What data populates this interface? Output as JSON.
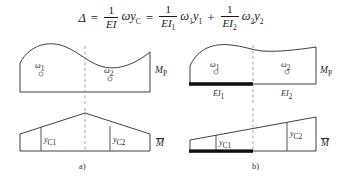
{
  "figure": {
    "formula": {
      "lhs": "Δ",
      "equals": "=",
      "plus": "+",
      "term1": {
        "num": "1",
        "den": "EI",
        "den_sub": "",
        "body": "ωy",
        "body_sub": "C"
      },
      "term2": {
        "num": "1",
        "den": "EI",
        "den_sub": "1",
        "body": "ω",
        "body_sub": "1",
        "body2": "y",
        "body2_sub": "1"
      },
      "term3": {
        "num": "1",
        "den": "EI",
        "den_sub": "2",
        "body": "ω",
        "body_sub": "2",
        "body2": "y",
        "body2_sub": "2"
      },
      "plain_text": "Δ = (1/EI)ωy_C = (1/EI₁)ω₁y₁ + (1/EI₂)ω₂y₂"
    },
    "panel_a": {
      "caption": "a)",
      "top_diagram": {
        "name": "bending-moment-diagram-Mp",
        "right_label": "M",
        "right_label_sub": "P",
        "area1_label": "ω",
        "area1_sub": "1",
        "area2_label": "ω",
        "area2_sub": "2",
        "centroid_marker": "○"
      },
      "bottom_diagram": {
        "name": "unit-moment-diagram-Mbar",
        "right_label": "M",
        "right_label_overbar": true,
        "ordinate1": "y",
        "ordinate1_sub": "C1",
        "ordinate2": "y",
        "ordinate2_sub": "C2"
      }
    },
    "panel_b": {
      "caption": "b)",
      "top_diagram": {
        "name": "bending-moment-diagram-Mp",
        "right_label": "M",
        "right_label_sub": "P",
        "area1_label": "ω",
        "area1_sub": "1",
        "area2_label": "ω",
        "area2_sub": "2",
        "stiffness1": "EI",
        "stiffness1_sub": "1",
        "stiffness2": "EI",
        "stiffness2_sub": "2",
        "centroid_marker": "○"
      },
      "bottom_diagram": {
        "name": "unit-moment-diagram-Mbar",
        "right_label": "M",
        "right_label_overbar": true,
        "ordinate1": "y",
        "ordinate1_sub": "C1",
        "ordinate2": "y",
        "ordinate2_sub": "C2"
      }
    },
    "colors": {
      "ink": "#2a2a2a",
      "thick_bar": "#111111",
      "dashed": "#8a8a8a",
      "background": "#ffffff"
    }
  }
}
